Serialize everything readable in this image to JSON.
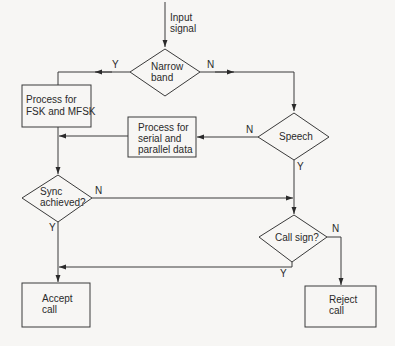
{
  "diagram": {
    "type": "flowchart",
    "colors": {
      "background": "#f7f6f4",
      "stroke": "#3a3a3a",
      "text": "#2a2a2a"
    },
    "input": {
      "label_line1": "Input",
      "label_line2": "signal"
    },
    "nodes": {
      "narrow_band": {
        "kind": "decision",
        "line1": "Narrow",
        "line2": "band"
      },
      "process_fsk": {
        "kind": "process",
        "line1": "Process for",
        "line2": "FSK and MFSK"
      },
      "speech": {
        "kind": "decision",
        "line1": "Speech"
      },
      "process_serial": {
        "kind": "process",
        "line1": "Process for",
        "line2": "serial and",
        "line3": "parallel data"
      },
      "sync": {
        "kind": "decision",
        "line1": "Sync",
        "line2": "achieved?"
      },
      "call_sign": {
        "kind": "decision",
        "line1": "Call sign?"
      },
      "accept": {
        "kind": "terminal-box",
        "line1": "Accept",
        "line2": "call"
      },
      "reject": {
        "kind": "terminal-box",
        "line1": "Reject",
        "line2": "call"
      }
    },
    "edges": [
      {
        "from": "input",
        "to": "narrow_band",
        "label": ""
      },
      {
        "from": "narrow_band",
        "to": "process_fsk",
        "label": "Y"
      },
      {
        "from": "narrow_band",
        "to": "speech",
        "label": "N"
      },
      {
        "from": "speech",
        "to": "process_serial",
        "label": "N"
      },
      {
        "from": "speech",
        "to": "call_sign",
        "label": "Y"
      },
      {
        "from": "process_fsk",
        "to": "sync",
        "label": ""
      },
      {
        "from": "process_serial",
        "to": "sync",
        "label": ""
      },
      {
        "from": "sync",
        "to": "call_sign",
        "label": "N"
      },
      {
        "from": "sync",
        "to": "accept",
        "label": "Y"
      },
      {
        "from": "call_sign",
        "to": "accept",
        "label": "Y"
      },
      {
        "from": "call_sign",
        "to": "reject",
        "label": "N"
      }
    ],
    "edge_labels": {
      "y": "Y",
      "n": "N"
    }
  }
}
